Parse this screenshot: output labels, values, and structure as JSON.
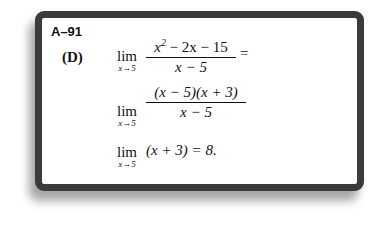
{
  "problem": {
    "id": "A–91",
    "option": "(D)",
    "lim_word": "lim",
    "lim_sub": "x→5",
    "step1": {
      "num_a": "x",
      "num_sup": "2",
      "num_b": " − 2x − 15",
      "den": "x − 5",
      "after": "="
    },
    "step2": {
      "num": "(x − 5)(x + 3)",
      "den": "x − 5"
    },
    "step3": {
      "expr": "(x + 3) = 8."
    }
  }
}
